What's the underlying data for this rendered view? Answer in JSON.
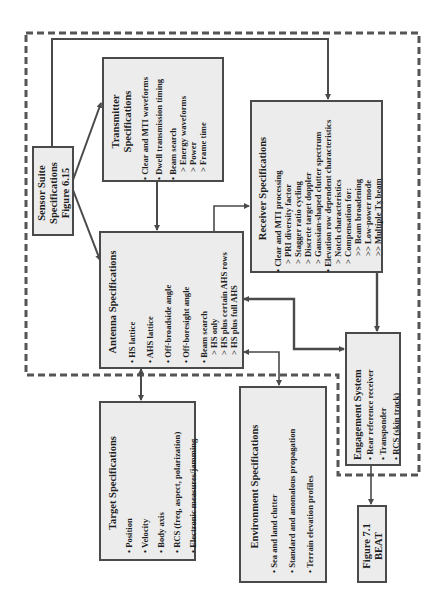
{
  "colors": {
    "box_fill": "#ececec",
    "line": "#4a4a4a",
    "dashed": "#555555"
  },
  "sensor_suite": {
    "lines": [
      "Sensor Suite",
      "Specifications",
      "Figure 6.15"
    ]
  },
  "transmitter": {
    "title": [
      "Transmitter",
      "Specifications"
    ],
    "items": [
      {
        "text": "• Clear and MTI waveforms",
        "level": 0
      },
      {
        "text": "• Dwell transmission timing",
        "level": 0
      },
      {
        "text": "• Beam search",
        "level": 0
      },
      {
        "text": "> Energy waveforms",
        "level": 1
      },
      {
        "text": "> Power",
        "level": 1
      },
      {
        "text": "> Frame time",
        "level": 1
      }
    ]
  },
  "antenna": {
    "title": "Antenna Specifications",
    "items": [
      {
        "text": "•  HS lattice",
        "level": 0
      },
      {
        "text": "•  AHS lattice",
        "level": 0
      },
      {
        "text": "•  Off-broadside angle",
        "level": 0
      },
      {
        "text": "•  Off-boresight angle",
        "level": 0
      },
      {
        "text": "•  Beam search",
        "level": 0
      },
      {
        "text": "> HS only",
        "level": 1
      },
      {
        "text": "> HS plus certain AHS rows",
        "level": 1
      },
      {
        "text": "> HS plus full AHS",
        "level": 1
      }
    ]
  },
  "receiver": {
    "title": "Receiver Specifications",
    "items": [
      {
        "text": "• Clear and MTI processing",
        "level": 0
      },
      {
        "text": "> PRI diversity factor",
        "level": 1
      },
      {
        "text": "> Stagger ratio cycling",
        "level": 1
      },
      {
        "text": "> Discrete target doppler",
        "level": 1
      },
      {
        "text": "> Gaussian-shaped clutter spectrum",
        "level": 1
      },
      {
        "text": "• Elevation row dependent characteristics",
        "level": 0
      },
      {
        "text": "> Notch characteristics",
        "level": 1
      },
      {
        "text": "> Compensation for:",
        "level": 1
      },
      {
        "text": ">> Beam broadening",
        "level": 2
      },
      {
        "text": ">> Low-power mode",
        "level": 2
      },
      {
        "text": ">> Multiple Tx beam",
        "level": 2
      }
    ]
  },
  "target": {
    "title": "Target Specifications",
    "items": [
      {
        "text": "•  Position"
      },
      {
        "text": "•  Velocity"
      },
      {
        "text": "•  Body axis"
      },
      {
        "text": "•  RCS (freq, aspect, polarization)"
      },
      {
        "text": "•  Electronic measures/jamming"
      }
    ]
  },
  "environment": {
    "title": "Environment Specifications",
    "items": [
      {
        "text": "•  Sea and land clutter"
      },
      {
        "text": "•  Standard and anomalous propagation"
      },
      {
        "text": "•  Terrain elevation profiles"
      }
    ]
  },
  "engagement": {
    "title": "Engagement System",
    "items": [
      {
        "text": "•  Rear reference receiver"
      },
      {
        "text": "•  Transponder"
      },
      {
        "text": "•  RCS (skin track)"
      }
    ]
  },
  "beat": {
    "lines": [
      "Figure 7.1",
      "BEAT"
    ]
  }
}
